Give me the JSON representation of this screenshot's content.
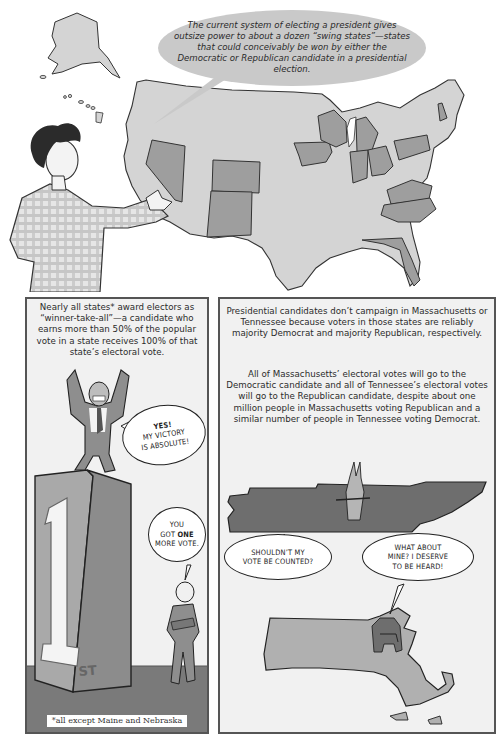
{
  "top_panel": {
    "narration": "The current system of electing a president gives outsize power to about a dozen “swing states”—states that could conceivably be won by either the Democratic or Republican candidate in a presidential election.",
    "map": {
      "base_color": "#d4d4d4",
      "swing_state_color": "#9e9e9e",
      "outline_color": "#333333",
      "highlighted_states": [
        "Nevada",
        "Colorado",
        "New Mexico",
        "Iowa",
        "Wisconsin",
        "Michigan",
        "Indiana",
        "Ohio",
        "Pennsylvania",
        "Virginia",
        "North Carolina",
        "Florida",
        "New Hampshire"
      ]
    }
  },
  "left_panel": {
    "caption": "Nearly all states* award electors as “winner-take-all”—a candidate who earns more than 50% of the popular vote in a state receives 100% of that state’s electoral vote.",
    "bubble_winner": {
      "line1": "YES!",
      "line2": "MY VICTORY",
      "line3": "IS ABSOLUTE!"
    },
    "bubble_voter": {
      "line1": "YOU",
      "line2_pre": "GOT ",
      "line2_bold": "ONE",
      "line3": "MORE VOTE."
    },
    "pedestal_label": {
      "number": "1",
      "suffix": "ST"
    },
    "footnote": "*all except Maine and Nebraska"
  },
  "right_panel": {
    "caption_1": "Presidential candidates don’t campaign in Massachusetts or Tennessee because voters in those states are reliably majority Democrat and majority Republican, respectively.",
    "caption_2": "All of Massachusetts’ electoral votes will go to the Democratic candidate and all of Tennessee’s electoral votes will go to the Republican candidate, despite about one million people in Massachusetts voting Republican and a similar number of people in Tennessee voting Democrat.",
    "bubble_donkey": {
      "line1": "SHOULDN’T MY",
      "line2": "VOTE BE COUNTED?"
    },
    "bubble_elephant": {
      "line1": "WHAT ABOUT",
      "line2": "MINE? I DESERVE",
      "line3": "TO BE HEARD!"
    },
    "tennessee_color": "#6e6e6e",
    "massachusetts_color": "#b0b0b0"
  }
}
